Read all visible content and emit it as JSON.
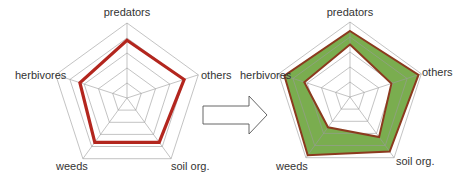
{
  "chart_data": [
    {
      "type": "radar",
      "title": "",
      "axes": [
        "predators",
        "others",
        "soil org.",
        "weeds",
        "herbivores"
      ],
      "levels": 5,
      "range": [
        0,
        1
      ],
      "series": [
        {
          "name": "before",
          "values": [
            0.77,
            0.8,
            0.73,
            0.73,
            0.66
          ],
          "color": "#b3261e"
        }
      ]
    },
    {
      "type": "radar",
      "title": "",
      "axes": [
        "predators",
        "others",
        "soil org.",
        "weeds",
        "herbivores"
      ],
      "levels": 5,
      "range": [
        0,
        1
      ],
      "series": [
        {
          "name": "upper",
          "values": [
            0.88,
            0.96,
            0.9,
            0.96,
            0.92
          ],
          "color": "#8b3a1e"
        },
        {
          "name": "lower",
          "values": [
            0.7,
            0.58,
            0.66,
            0.5,
            0.64
          ],
          "color": "#8b3a1e"
        }
      ],
      "band_fill": "#7aad4f"
    }
  ],
  "labels": {
    "predators": "predators",
    "others": "others",
    "soil": "soil org.",
    "weeds": "weeds",
    "herbivores": "herbivores"
  },
  "arrow": {
    "direction": "right"
  }
}
